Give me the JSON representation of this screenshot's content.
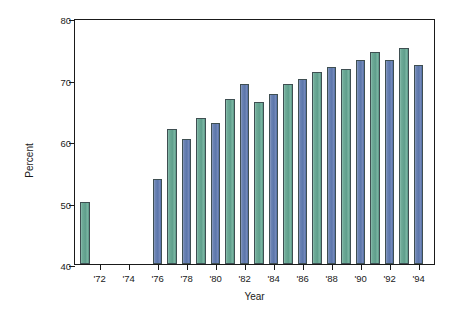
{
  "chart_data": {
    "type": "bar",
    "title": "",
    "xlabel": "Year",
    "ylabel": "Percent",
    "ylim": [
      40,
      80
    ],
    "yticks": [
      40,
      50,
      60,
      70,
      80
    ],
    "ytick_labels": [
      "40",
      "50",
      "60",
      "70",
      "80"
    ],
    "xlim": [
      1970.3,
      1995.2
    ],
    "xticks": [
      1972,
      1974,
      1976,
      1978,
      1980,
      1982,
      1984,
      1986,
      1988,
      1990,
      1992,
      1994
    ],
    "xtick_labels": [
      "'72",
      "'74",
      "'76",
      "'78",
      "'80",
      "'82",
      "'84",
      "'86",
      "'88",
      "'90",
      "'92",
      "'94"
    ],
    "grid": false,
    "legend": "none",
    "categories": [
      "1971",
      "1976",
      "1977",
      "1978",
      "1979",
      "1980",
      "1981",
      "1982",
      "1983",
      "1984",
      "1985",
      "1986",
      "1987",
      "1988",
      "1989",
      "1990",
      "1991",
      "1992",
      "1993",
      "1994"
    ],
    "values": [
      50.1,
      53.8,
      61.9,
      60.4,
      63.8,
      62.9,
      66.9,
      69.3,
      66.4,
      67.6,
      69.3,
      70.1,
      71.3,
      72.1,
      71.7,
      73.2,
      74.5,
      73.1,
      75.1,
      72.4
    ],
    "bar_colors": [
      "green",
      "blue",
      "green",
      "blue",
      "green",
      "blue",
      "green",
      "blue",
      "green",
      "blue",
      "green",
      "blue",
      "green",
      "blue",
      "green",
      "blue",
      "green",
      "blue",
      "green",
      "blue"
    ],
    "colors": {
      "green": "#6aa894",
      "blue": "#5b76ab",
      "bar_outline": "#3f4f52",
      "axis": "#1a1a1a",
      "background": "#ffffff"
    }
  }
}
